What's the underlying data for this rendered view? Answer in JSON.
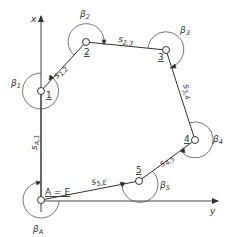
{
  "diagram": {
    "type": "traverse-polygon",
    "axes": {
      "x_label": "x",
      "y_label": "y"
    },
    "points": [
      {
        "id": "A=E",
        "label": "A = E",
        "x": 41,
        "y": 200
      },
      {
        "id": "1",
        "label": "1",
        "x": 41,
        "y": 91
      },
      {
        "id": "2",
        "label": "2",
        "x": 86,
        "y": 42
      },
      {
        "id": "3",
        "label": "3",
        "x": 166,
        "y": 50
      },
      {
        "id": "4",
        "label": "4",
        "x": 195,
        "y": 140
      },
      {
        "id": "5",
        "label": "5",
        "x": 139,
        "y": 181
      }
    ],
    "sides": [
      {
        "from": "A",
        "to": "1",
        "label": "s",
        "sub": "A,1"
      },
      {
        "from": "1",
        "to": "2",
        "label": "s",
        "sub": "1,2"
      },
      {
        "from": "2",
        "to": "3",
        "label": "s",
        "sub": "2,3"
      },
      {
        "from": "3",
        "to": "4",
        "label": "s",
        "sub": "3,4"
      },
      {
        "from": "4",
        "to": "5",
        "label": "s",
        "sub": "4,5"
      },
      {
        "from": "5",
        "to": "E",
        "label": "s",
        "sub": "5,E"
      }
    ],
    "angles": [
      {
        "at": "1",
        "label": "β",
        "sub": "1"
      },
      {
        "at": "2",
        "label": "β",
        "sub": "2"
      },
      {
        "at": "3",
        "label": "β",
        "sub": "3"
      },
      {
        "at": "4",
        "label": "β",
        "sub": "4"
      },
      {
        "at": "5",
        "label": "β",
        "sub": "5"
      },
      {
        "at": "A",
        "label": "β",
        "sub": "A"
      }
    ]
  }
}
